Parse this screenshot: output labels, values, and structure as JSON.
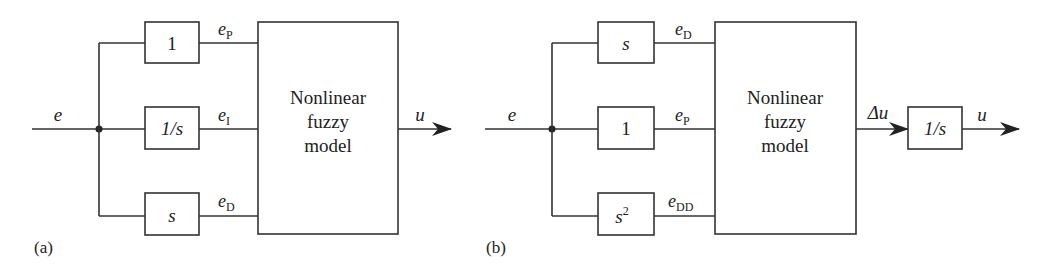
{
  "figure": {
    "panel_a": {
      "label": "(a)",
      "input_signal": "e",
      "output_signal": "u",
      "model_lines": [
        "Nonlinear",
        "fuzzy",
        "model"
      ],
      "branches": [
        {
          "block": "1",
          "signal": "e",
          "signal_sub": "P"
        },
        {
          "block": "1/s",
          "signal": "e",
          "signal_sub": "I"
        },
        {
          "block": "s",
          "signal": "e",
          "signal_sub": "D"
        }
      ]
    },
    "panel_b": {
      "label": "(b)",
      "input_signal": "e",
      "model_output": "Δu",
      "integrator_block": "1/s",
      "output_signal": "u",
      "model_lines": [
        "Nonlinear",
        "fuzzy",
        "model"
      ],
      "branches": [
        {
          "block": "s",
          "signal": "e",
          "signal_sub": "D"
        },
        {
          "block": "1",
          "signal": "e",
          "signal_sub": "P"
        },
        {
          "block": "s",
          "block_sup": "2",
          "signal": "e",
          "signal_sub": "DD"
        }
      ]
    }
  }
}
